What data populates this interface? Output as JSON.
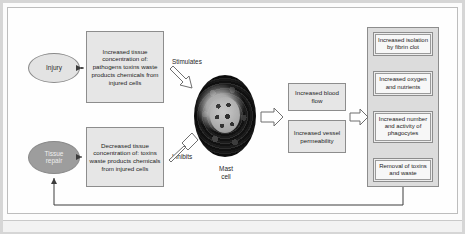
{
  "diagram": {
    "nodes": {
      "injury": "Injury",
      "tissue_repair": "Tissue\nrepair",
      "increased_concentration": "Increased tissue concentration of: pathogens toxins waste products chemicals from injured cells",
      "decreased_concentration": "Decreased tissue concentration of: toxins waste products chemicals from injured cells",
      "mast_cell": "Mast\ncell",
      "blood_flow": "Increased blood flow",
      "vessel_permeability": "Increased vessel permeability"
    },
    "edge_labels": {
      "stimulates": "Stimulates",
      "inhibits": "Inhibits"
    },
    "outcomes": [
      "Increased isolation by fibrin clot",
      "Increased oxygen and nutrients",
      "Increased number and activity of phagocytes",
      "Removal of toxins and waste"
    ],
    "colors": {
      "frame_border": "#d6d6d6",
      "box_fill": "#e6e6e6",
      "box_border": "#8d8d8d",
      "injury_fill": "#e3e3e3",
      "tissue_repair_fill": "#9d9d9d",
      "panel_fill": "#dcdcdc",
      "outcome_fill": "#f7f7f7",
      "mast_cell_fill": "#1e1e1e",
      "line": "#4a4a4a"
    }
  }
}
